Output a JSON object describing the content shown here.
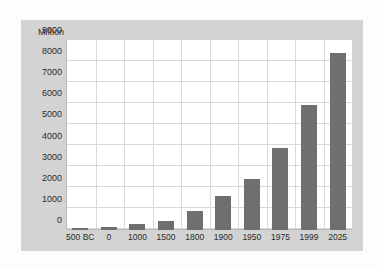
{
  "chart_data": {
    "type": "bar",
    "title": "",
    "subtitle": "",
    "xlabel": "",
    "ylabel": "Million",
    "unit_label": "Million",
    "categories": [
      "500 BC",
      "0",
      "1000",
      "1500",
      "1800",
      "1900",
      "1950",
      "1975",
      "1999",
      "2025"
    ],
    "values": [
      100,
      150,
      265,
      425,
      900,
      1600,
      2400,
      3900,
      5900,
      8400
    ],
    "series": [
      {
        "name": "World population",
        "values": [
          100,
          150,
          265,
          425,
          900,
          1600,
          2400,
          3900,
          5900,
          8400
        ]
      }
    ],
    "ylim": [
      0,
      9000
    ],
    "ytick_labels": [
      "0",
      "1000",
      "2000",
      "3000",
      "4000",
      "5000",
      "6000",
      "7000",
      "8000",
      "9000"
    ],
    "ytick_values": [
      0,
      1000,
      2000,
      3000,
      4000,
      5000,
      6000,
      7000,
      8000,
      9000
    ],
    "grid": "horizontal-and-vertical",
    "legend": "none",
    "bar_color": "#6f6f6f",
    "plot_background": "#ffffff",
    "panel_background": "#d3d3d3",
    "gridline_color": "#d8d8d8",
    "axis_color": "#b9b9b9"
  }
}
